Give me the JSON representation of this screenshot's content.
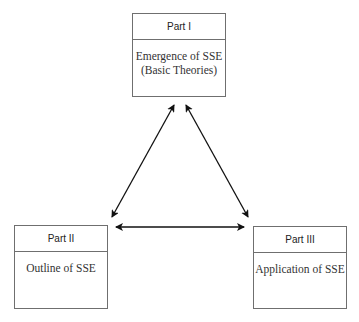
{
  "diagram": {
    "parts": [
      {
        "header": "Part I",
        "lines": [
          "Emergence of SSE",
          "(Basic Theories)"
        ]
      },
      {
        "header": "Part II",
        "lines": [
          "Outline of SSE"
        ]
      },
      {
        "header": "Part III",
        "lines": [
          "Application of SSE"
        ]
      }
    ],
    "connections": [
      {
        "from": "Part I",
        "to": "Part II",
        "type": "bidirectional"
      },
      {
        "from": "Part I",
        "to": "Part III",
        "type": "bidirectional"
      },
      {
        "from": "Part II",
        "to": "Part III",
        "type": "bidirectional"
      }
    ],
    "colors": {
      "border": "#6f6f6f",
      "arrow": "#111111"
    }
  }
}
